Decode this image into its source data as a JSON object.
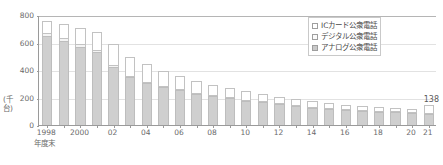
{
  "chart_data": {
    "type": "bar",
    "stacked": true,
    "title": "",
    "xlabel": "年度末",
    "ylabel": "(千台)",
    "ylim": [
      0,
      800
    ],
    "yticks": [
      0,
      200,
      400,
      600,
      800
    ],
    "grid": true,
    "legend_position": "top-right",
    "categories": [
      "1998",
      "1999",
      "2000",
      "01",
      "02",
      "03",
      "04",
      "05",
      "06",
      "07",
      "08",
      "09",
      "10",
      "11",
      "12",
      "13",
      "14",
      "15",
      "16",
      "17",
      "18",
      "19",
      "20",
      "21"
    ],
    "tick_labels": [
      "1998",
      "",
      "2000",
      "",
      "02",
      "",
      "04",
      "",
      "06",
      "",
      "08",
      "",
      "10",
      "",
      "12",
      "",
      "14",
      "",
      "16",
      "",
      "18",
      "",
      "20",
      "21"
    ],
    "series": [
      {
        "name": "アナログ公衆電話",
        "color": "#cfcfcf",
        "values": [
          645,
          610,
          570,
          532,
          424,
          346,
          303,
          275,
          252,
          228,
          213,
          196,
          178,
          165,
          152,
          138,
          127,
          118,
          110,
          103,
          97,
          92,
          86,
          80
        ]
      },
      {
        "name": "デジタル公衆電話",
        "color": "#f4f4f4",
        "values": [
          22,
          20,
          18,
          16,
          14,
          12,
          10,
          9,
          8,
          7,
          6,
          5,
          4,
          4,
          3,
          3,
          3,
          2,
          2,
          2,
          2,
          2,
          2,
          2
        ]
      },
      {
        "name": "ICカード公衆電話",
        "color": "#ffffff",
        "values": [
          88,
          105,
          115,
          130,
          148,
          140,
          128,
          112,
          97,
          85,
          74,
          67,
          60,
          53,
          47,
          42,
          38,
          34,
          31,
          28,
          26,
          24,
          22,
          56
        ]
      }
    ],
    "annotations": [
      {
        "text": "138",
        "category": "21",
        "value": 138
      }
    ]
  },
  "legend": {
    "items": [
      {
        "label": "ICカード公衆電話",
        "swatch": "ic"
      },
      {
        "label": "デジタル公衆電話",
        "swatch": "digital"
      },
      {
        "label": "アナログ公衆電話",
        "swatch": "analog"
      }
    ]
  },
  "axes": {
    "y_title": "(千台)",
    "x_title": "年度末"
  }
}
